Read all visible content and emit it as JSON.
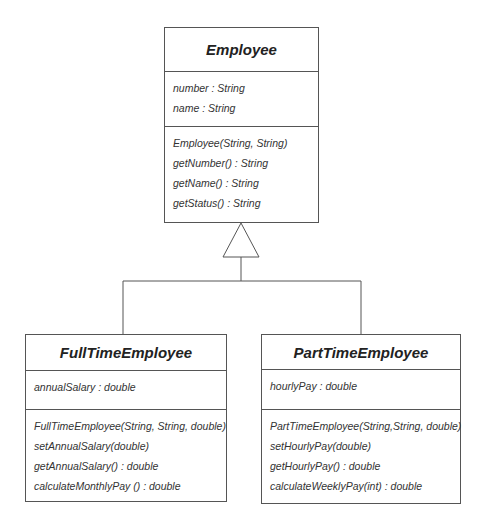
{
  "diagram": {
    "type": "UML class diagram",
    "relationship": "generalization",
    "line_color": "#555555",
    "classes": [
      {
        "id": "employee",
        "name": "Employee",
        "attributes": [
          "number : String",
          "name : String"
        ],
        "operations": [
          "Employee(String, String)",
          "getNumber() : String",
          "getName() : String",
          "getStatus() : String"
        ]
      },
      {
        "id": "fulltime",
        "name": "FullTimeEmployee",
        "attributes": [
          "annualSalary : double"
        ],
        "operations": [
          "FullTimeEmployee(String, String, double)",
          "setAnnualSalary(double)",
          "getAnnualSalary() : double",
          "calculateMonthlyPay () : double"
        ]
      },
      {
        "id": "parttime",
        "name": "PartTimeEmployee",
        "attributes": [
          "hourlyPay : double"
        ],
        "operations": [
          "PartTimeEmployee(String,String, double)",
          "setHourlyPay(double)",
          "getHourlyPay() : double",
          "calculateWeeklyPay(int) : double"
        ]
      }
    ],
    "edges": [
      {
        "from": "FullTimeEmployee",
        "to": "Employee",
        "kind": "inheritance"
      },
      {
        "from": "PartTimeEmployee",
        "to": "Employee",
        "kind": "inheritance"
      }
    ]
  }
}
